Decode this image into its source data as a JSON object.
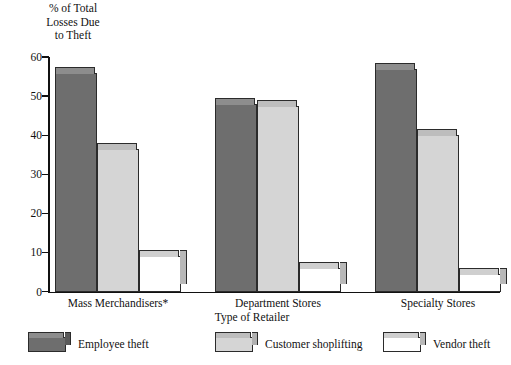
{
  "chart_data": {
    "type": "bar",
    "title": "",
    "ylabel": "% of Total Losses Due to Theft",
    "xlabel": "Type of Retailer",
    "categories": [
      "Mass Merchandisers*",
      "Department Stores",
      "Specialty Stores"
    ],
    "series": [
      {
        "name": "Employee theft",
        "values": [
          56,
          48,
          57
        ],
        "color": "#6e6e6e",
        "top_color": "#8d8d8d",
        "side_color": "#5a5a5a"
      },
      {
        "name": "Customer shoplifting",
        "values": [
          36.5,
          47.5,
          40
        ],
        "color": "#d5d5d5",
        "top_color": "#bdbdbd",
        "side_color": "#b0b0b0"
      },
      {
        "name": "Vendor theft",
        "values": [
          9,
          6,
          4.5
        ],
        "color": "#ffffff",
        "top_color": "#cfcfcf",
        "side_color": "#b8b8b8"
      }
    ],
    "ylim": [
      0,
      60
    ],
    "yticks": [
      0,
      10,
      20,
      30,
      40,
      50,
      60
    ],
    "ytick_labels": [
      "0",
      "10",
      "20",
      "30",
      "40",
      "50",
      "60"
    ],
    "grid": false,
    "legend_position": "bottom"
  },
  "axes": {
    "y_title_lines": "% of Total\nLosses Due\nto Theft",
    "x_title": "Type of Retailer"
  }
}
